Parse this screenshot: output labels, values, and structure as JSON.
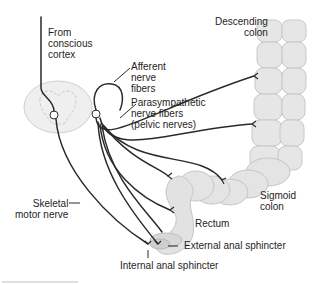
{
  "diagram": {
    "type": "anatomical-illustration",
    "colors": {
      "organ_fill": "#e4e4e4",
      "organ_stroke": "#c6c6c6",
      "nerve": "#2a2a2a",
      "text": "#1e1e1e",
      "spinal_cord_fill": "#ededed"
    },
    "labels": {
      "from_cortex": "From\nconscious\ncortex",
      "afferent": "Afferent\nnerve\nfibers",
      "parasympathetic": "Parasympathetic\nnerve fibers\n(pelvic nerves)",
      "descending_colon": "Descending\ncolon",
      "sigmoid_colon": "Sigmoid\ncolon",
      "rectum": "Rectum",
      "skeletal_motor": "Skeletal\nmotor nerve",
      "external_sphincter": "External anal sphincter",
      "internal_sphincter": "Internal anal sphincter"
    }
  }
}
